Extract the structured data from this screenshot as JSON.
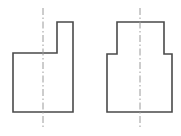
{
  "drawing": {
    "title": "Two orthographic views of a stepped block",
    "canvas": {
      "width": 181,
      "height": 136,
      "background": "#ffffff"
    },
    "style": {
      "outline_color": "#4a4a4a",
      "outline_width": 1.6,
      "centerline_color": "#9a9a9a",
      "centerline_width": 1,
      "centerline_dash": "7,2.5,1.5,2.5"
    },
    "views": [
      {
        "id": "front-view",
        "label": "Front view (L-shaped stepped profile)",
        "shape_type": "polygon",
        "points": "13,53 57,53 57,22 73,22 73,112 13,112",
        "bounds": {
          "x": 13,
          "y": 22,
          "width": 60,
          "height": 90
        },
        "centerline": {
          "x": 43,
          "y1": 8,
          "y2": 129
        }
      },
      {
        "id": "top-view",
        "label": "Top view (T-shaped stepped profile)",
        "shape_type": "polygon",
        "points": "117,22 164,22 164,54 172,54 172,112 107,112 107,54 117,54",
        "bounds": {
          "x": 107,
          "y": 22,
          "width": 65,
          "height": 90
        },
        "centerline": {
          "x": 140,
          "y1": 8,
          "y2": 129
        }
      }
    ]
  }
}
